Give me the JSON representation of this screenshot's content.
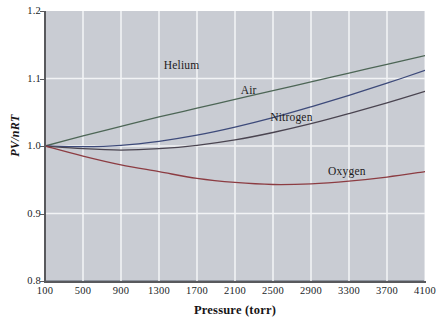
{
  "chart_data": {
    "type": "line",
    "title": "",
    "xlabel": "Pressure (torr)",
    "ylabel": "PV/nRT",
    "xlim": [
      100,
      4100
    ],
    "ylim": [
      0.8,
      1.2
    ],
    "grid": true,
    "legend_position": "inline-curve-labels",
    "xticks": [
      100,
      500,
      900,
      1300,
      1700,
      2100,
      2500,
      2900,
      3300,
      3700,
      4100
    ],
    "xtick_labels": [
      "100",
      "500",
      "900",
      "1300",
      "1700",
      "2100",
      "2500",
      "2900",
      "3300",
      "3700",
      "4100"
    ],
    "yticks": [
      0.8,
      0.9,
      1.0,
      1.1,
      1.2
    ],
    "ytick_labels": [
      "0.8",
      "0.9",
      "1.0",
      "1.1",
      "1.2"
    ],
    "x": [
      100,
      500,
      900,
      1300,
      1700,
      2100,
      2500,
      2900,
      3300,
      3700,
      4100
    ],
    "series": [
      {
        "name": "Helium",
        "color": "#4d6656",
        "values": [
          1.0,
          1.015,
          1.029,
          1.043,
          1.056,
          1.069,
          1.082,
          1.095,
          1.108,
          1.121,
          1.134
        ],
        "label_x": 1350,
        "label_y": 1.118
      },
      {
        "name": "Air",
        "color": "#3d4a7a",
        "values": [
          1.0,
          0.999,
          1.001,
          1.007,
          1.016,
          1.028,
          1.042,
          1.058,
          1.075,
          1.093,
          1.112
        ],
        "label_x": 2160,
        "label_y": 1.082
      },
      {
        "name": "Nitrogen",
        "color": "#4a4450",
        "values": [
          1.0,
          0.996,
          0.994,
          0.996,
          1.001,
          1.009,
          1.02,
          1.033,
          1.048,
          1.064,
          1.081
        ],
        "label_x": 2470,
        "label_y": 1.041
      },
      {
        "name": "Oxygen",
        "color": "#8c3c42",
        "values": [
          1.0,
          0.985,
          0.972,
          0.962,
          0.952,
          0.946,
          0.943,
          0.944,
          0.948,
          0.954,
          0.962
        ],
        "label_x": 3080,
        "label_y": 0.962
      }
    ],
    "colors": {
      "plot_background": "#c9ccd3",
      "gridline": "#f2f3f5",
      "axis": "#58595d",
      "text": "#201e1f"
    }
  }
}
